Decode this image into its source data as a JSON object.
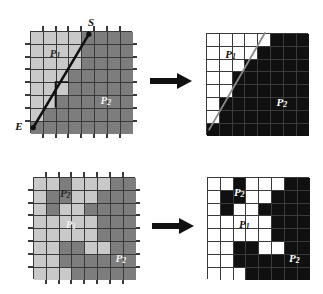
{
  "figure": {
    "width": 323,
    "height": 294,
    "background": "#ffffff"
  },
  "colors": {
    "light_gray": "#c9c9c9",
    "dark_gray": "#7d7d7d",
    "grid_line": "#3a3a3a",
    "black": "#101010",
    "white": "#ffffff",
    "arrow": "#111111",
    "segment": "#111111",
    "segment_light": "#8a8a8a",
    "label_dark": "#2a2a2a",
    "label_light": "#f0f0f0"
  },
  "labels": {
    "p1": "P",
    "p1_sub": "1",
    "p2": "P",
    "p2_sub": "2",
    "start": "S",
    "end": "E"
  },
  "arrows": {
    "top": "arrow-right",
    "bottom": "arrow-right"
  },
  "panels": [
    {
      "id": "top-left",
      "name": "source-line-segment-grid",
      "cols": 8,
      "rows": 8,
      "palette": [
        "light_gray",
        "dark_gray"
      ],
      "cells": [
        [
          0,
          0,
          0,
          0,
          1,
          1,
          1,
          1
        ],
        [
          0,
          0,
          0,
          0,
          1,
          1,
          1,
          1
        ],
        [
          0,
          0,
          0,
          0,
          1,
          1,
          1,
          1
        ],
        [
          0,
          0,
          0,
          1,
          1,
          1,
          1,
          1
        ],
        [
          0,
          0,
          0,
          1,
          1,
          1,
          1,
          1
        ],
        [
          0,
          0,
          1,
          1,
          1,
          1,
          1,
          1
        ],
        [
          0,
          1,
          1,
          1,
          1,
          1,
          1,
          1
        ],
        [
          1,
          1,
          1,
          1,
          1,
          1,
          1,
          1
        ]
      ],
      "annotations": [
        {
          "name": "region-label-p1",
          "text": "P",
          "sub": "1",
          "col": 1.55,
          "row": 1.3,
          "tone": "dark"
        },
        {
          "name": "region-label-p2",
          "text": "P",
          "sub": "2",
          "col": 5.5,
          "row": 5.0,
          "tone": "light"
        }
      ],
      "segment": {
        "x1_col": 0.25,
        "y1_row": 7.55,
        "x2_col": 4.6,
        "y2_row": 0.25,
        "start_label": "S",
        "end_label": "E"
      }
    },
    {
      "id": "top-right",
      "name": "rasterized-line-segment-grid",
      "cols": 8,
      "rows": 8,
      "palette": [
        "white",
        "black"
      ],
      "cells": [
        [
          0,
          0,
          0,
          0,
          0,
          1,
          1,
          1
        ],
        [
          0,
          0,
          0,
          0,
          1,
          1,
          1,
          1
        ],
        [
          0,
          0,
          0,
          1,
          1,
          1,
          1,
          1
        ],
        [
          0,
          0,
          1,
          1,
          1,
          1,
          1,
          1
        ],
        [
          0,
          0,
          1,
          1,
          1,
          1,
          1,
          1
        ],
        [
          0,
          1,
          1,
          1,
          1,
          1,
          1,
          1
        ],
        [
          0,
          1,
          1,
          1,
          1,
          1,
          1,
          1
        ],
        [
          1,
          1,
          1,
          1,
          1,
          1,
          1,
          1
        ]
      ],
      "annotations": [
        {
          "name": "region-label-p1",
          "text": "P",
          "sub": "1",
          "col": 1.5,
          "row": 1.25,
          "tone": "on-white"
        },
        {
          "name": "region-label-p2",
          "text": "P",
          "sub": "2",
          "col": 5.5,
          "row": 5.0,
          "tone": "on-black"
        }
      ],
      "segment": {
        "x1_col": 0.25,
        "y1_row": 7.55,
        "x2_col": 4.6,
        "y2_row": 0.0
      }
    },
    {
      "id": "bottom-left",
      "name": "source-region-map-grid",
      "cols": 8,
      "rows": 8,
      "palette": [
        "light_gray",
        "dark_gray"
      ],
      "cells": [
        [
          0,
          0,
          1,
          0,
          0,
          0,
          1,
          1
        ],
        [
          0,
          1,
          1,
          0,
          0,
          1,
          1,
          1
        ],
        [
          0,
          1,
          0,
          0,
          1,
          1,
          1,
          1
        ],
        [
          0,
          0,
          0,
          0,
          0,
          1,
          1,
          1
        ],
        [
          0,
          0,
          0,
          0,
          0,
          1,
          1,
          1
        ],
        [
          0,
          0,
          1,
          1,
          0,
          0,
          1,
          1
        ],
        [
          0,
          0,
          1,
          1,
          1,
          1,
          1,
          1
        ],
        [
          0,
          0,
          0,
          1,
          1,
          1,
          1,
          1
        ]
      ],
      "annotations": [
        {
          "name": "region-label-p2-top",
          "text": "P",
          "sub": "2",
          "col": 2.1,
          "row": 0.85,
          "tone": "dark"
        },
        {
          "name": "region-label-p1",
          "text": "P",
          "sub": "1",
          "col": 2.55,
          "row": 3.3,
          "tone": "light"
        },
        {
          "name": "region-label-p2-bottom",
          "text": "P",
          "sub": "2",
          "col": 6.45,
          "row": 5.9,
          "tone": "light"
        }
      ]
    },
    {
      "id": "bottom-right",
      "name": "rasterized-region-map-grid",
      "cols": 8,
      "rows": 8,
      "palette": [
        "white",
        "black"
      ],
      "cells": [
        [
          0,
          0,
          1,
          0,
          0,
          0,
          1,
          1
        ],
        [
          0,
          1,
          1,
          0,
          0,
          1,
          1,
          1
        ],
        [
          0,
          1,
          0,
          0,
          1,
          1,
          1,
          1
        ],
        [
          0,
          0,
          0,
          0,
          0,
          1,
          1,
          1
        ],
        [
          0,
          0,
          0,
          0,
          0,
          1,
          1,
          1
        ],
        [
          0,
          0,
          1,
          1,
          0,
          0,
          1,
          1
        ],
        [
          0,
          0,
          1,
          1,
          1,
          1,
          1,
          1
        ],
        [
          0,
          0,
          0,
          1,
          1,
          1,
          1,
          1
        ]
      ],
      "annotations": [
        {
          "name": "region-label-p2-top",
          "text": "P",
          "sub": "2",
          "col": 2.1,
          "row": 0.8,
          "tone": "on-black"
        },
        {
          "name": "region-label-p1",
          "text": "P",
          "sub": "1",
          "col": 2.5,
          "row": 3.25,
          "tone": "on-white"
        },
        {
          "name": "region-label-p2-bottom",
          "text": "P",
          "sub": "2",
          "col": 6.4,
          "row": 5.9,
          "tone": "on-black"
        }
      ]
    }
  ],
  "geometry": {
    "cell": 12.8,
    "panel_positions": {
      "top-left": {
        "x": 30,
        "y": 31
      },
      "top-right": {
        "x": 206,
        "y": 33
      },
      "bottom-left": {
        "x": 33,
        "y": 177
      },
      "bottom-right": {
        "x": 207,
        "y": 177
      }
    },
    "arrow_positions": {
      "top": {
        "x": 150,
        "y": 72,
        "w": 42,
        "h": 18
      },
      "bottom": {
        "x": 152,
        "y": 217,
        "w": 42,
        "h": 18
      }
    }
  }
}
